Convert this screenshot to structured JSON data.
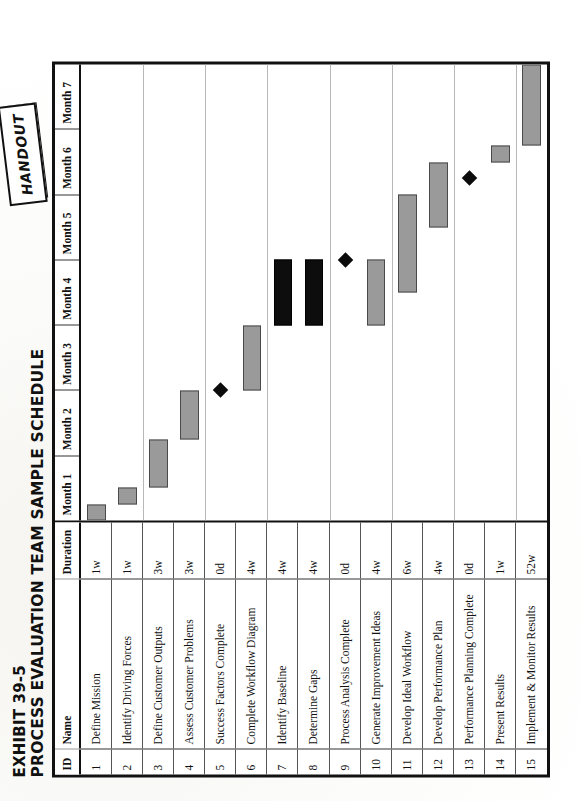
{
  "document": {
    "exhibit_label": "EXHIBIT 39-5",
    "title": "PROCESS EVALUATION TEAM SAMPLE SCHEDULE",
    "handout_badge": "HANDOUT"
  },
  "table": {
    "columns": [
      "ID",
      "Name",
      "Duration"
    ],
    "timeline_headers": [
      "Month 1",
      "Month 2",
      "Month 3",
      "Month 4",
      "Month 5",
      "Month 6",
      "Month 7"
    ]
  },
  "colors": {
    "bar_normal": "#9a9a9a",
    "bar_critical": "#0d0d0d",
    "milestone": "#0b0b0b",
    "frame": "#111111",
    "gridline": "#b8b8b8"
  },
  "chart_data": {
    "type": "bar",
    "title": "PROCESS EVALUATION TEAM SAMPLE SCHEDULE",
    "xlabel": "",
    "ylabel": "",
    "grid": true,
    "legend": "none",
    "x_axis": {
      "unit": "month",
      "ticks": [
        "Month 1",
        "Month 2",
        "Month 3",
        "Month 4",
        "Month 5",
        "Month 6",
        "Month 7"
      ],
      "range_weeks": [
        0,
        28
      ]
    },
    "tasks": [
      {
        "id": "1",
        "name": "Define Mission",
        "duration": "1w",
        "start_week": 0,
        "length_weeks": 1,
        "style": "normal",
        "milestone": false
      },
      {
        "id": "2",
        "name": "Identify Driving Forces",
        "duration": "1w",
        "start_week": 1,
        "length_weeks": 1,
        "style": "normal",
        "milestone": false
      },
      {
        "id": "3",
        "name": "Define Customer Outputs",
        "duration": "3w",
        "start_week": 2,
        "length_weeks": 3,
        "style": "normal",
        "milestone": false
      },
      {
        "id": "4",
        "name": "Assess Customer Problems",
        "duration": "3w",
        "start_week": 5,
        "length_weeks": 3,
        "style": "normal",
        "milestone": false
      },
      {
        "id": "5",
        "name": "Success Factors Complete",
        "duration": "0d",
        "start_week": 8,
        "length_weeks": 0,
        "style": "milestone",
        "milestone": true
      },
      {
        "id": "6",
        "name": "Complete Workflow Diagram",
        "duration": "4w",
        "start_week": 8,
        "length_weeks": 4,
        "style": "normal",
        "milestone": false
      },
      {
        "id": "7",
        "name": "Identify Baseline",
        "duration": "4w",
        "start_week": 12,
        "length_weeks": 4,
        "style": "critical",
        "milestone": false
      },
      {
        "id": "8",
        "name": "Determine Gaps",
        "duration": "4w",
        "start_week": 12,
        "length_weeks": 4,
        "style": "critical",
        "milestone": false
      },
      {
        "id": "9",
        "name": "Process Analysis Complete",
        "duration": "0d",
        "start_week": 16,
        "length_weeks": 0,
        "style": "milestone",
        "milestone": true
      },
      {
        "id": "10",
        "name": "Generate Improvement Ideas",
        "duration": "4w",
        "start_week": 12,
        "length_weeks": 4,
        "style": "normal",
        "milestone": false
      },
      {
        "id": "11",
        "name": "Develop Ideal Workflow",
        "duration": "6w",
        "start_week": 14,
        "length_weeks": 6,
        "style": "normal",
        "milestone": false
      },
      {
        "id": "12",
        "name": "Develop Performance Plan",
        "duration": "4w",
        "start_week": 18,
        "length_weeks": 4,
        "style": "normal",
        "milestone": false
      },
      {
        "id": "13",
        "name": "Performance Planning Complete",
        "duration": "0d",
        "start_week": 21,
        "length_weeks": 0,
        "style": "milestone",
        "milestone": true
      },
      {
        "id": "14",
        "name": "Present Results",
        "duration": "1w",
        "start_week": 22,
        "length_weeks": 1,
        "style": "normal",
        "milestone": false
      },
      {
        "id": "15",
        "name": "Implement & Monitor Results",
        "duration": "52w",
        "start_week": 23,
        "length_weeks": 5,
        "style": "normal",
        "milestone": false
      }
    ]
  }
}
